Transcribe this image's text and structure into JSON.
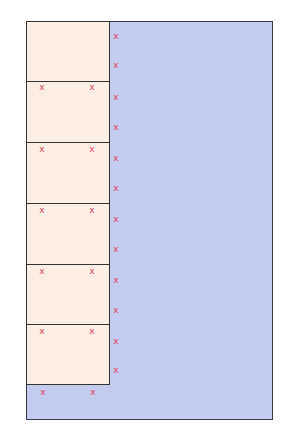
{
  "diagram": {
    "colors": {
      "frame_fill": "#c3cbee",
      "frame_border": "#3a3a44",
      "box_fill": "#fbeee4",
      "box_border": "#333333",
      "marker": "#e0455a"
    },
    "marker_glyph": "x",
    "boxes": [
      {
        "top": 21,
        "height": 62
      },
      {
        "top": 81,
        "height": 63
      },
      {
        "top": 142,
        "height": 63
      },
      {
        "top": 203,
        "height": 63
      },
      {
        "top": 264,
        "height": 62
      },
      {
        "top": 324,
        "height": 61
      }
    ],
    "markers": [
      {
        "x": 116,
        "y": 36
      },
      {
        "x": 116,
        "y": 65
      },
      {
        "x": 116,
        "y": 97
      },
      {
        "x": 116,
        "y": 127
      },
      {
        "x": 116,
        "y": 158
      },
      {
        "x": 116,
        "y": 188
      },
      {
        "x": 116,
        "y": 219
      },
      {
        "x": 116,
        "y": 249
      },
      {
        "x": 116,
        "y": 280
      },
      {
        "x": 116,
        "y": 310
      },
      {
        "x": 116,
        "y": 341
      },
      {
        "x": 116,
        "y": 370
      },
      {
        "x": 42,
        "y": 87
      },
      {
        "x": 92,
        "y": 87
      },
      {
        "x": 42,
        "y": 149
      },
      {
        "x": 92,
        "y": 149
      },
      {
        "x": 42,
        "y": 210
      },
      {
        "x": 92,
        "y": 210
      },
      {
        "x": 42,
        "y": 271
      },
      {
        "x": 92,
        "y": 271
      },
      {
        "x": 42,
        "y": 331
      },
      {
        "x": 92,
        "y": 331
      },
      {
        "x": 43,
        "y": 392
      },
      {
        "x": 93,
        "y": 392
      }
    ]
  }
}
